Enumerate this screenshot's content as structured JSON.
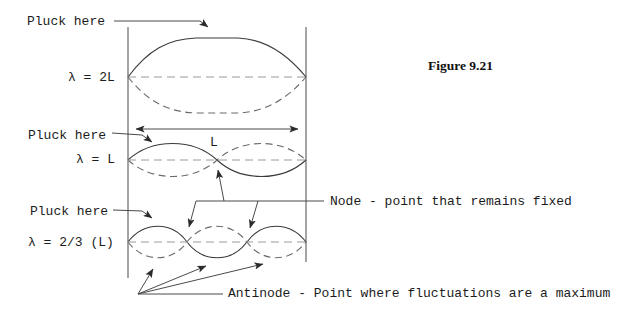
{
  "figure": {
    "caption": "Figure 9.21"
  },
  "modes": [
    {
      "pluck": "Pluck here",
      "wavelength": "λ = 2L"
    },
    {
      "pluck": "Pluck here",
      "wavelength": "λ = L",
      "length": "L"
    },
    {
      "pluck": "Pluck here",
      "wavelength": "λ = 2/3 (L)"
    }
  ],
  "annotations": {
    "node": "Node - point that remains fixed",
    "antinode": "Antinode - Point where fluctuations are a maximum"
  },
  "colors": {
    "ink": "#3a3a3a",
    "dashed_curve": "#6a6a6a",
    "centerline": "#9a9a9a",
    "text": "#1c1c1c",
    "background": "#ffffff"
  }
}
